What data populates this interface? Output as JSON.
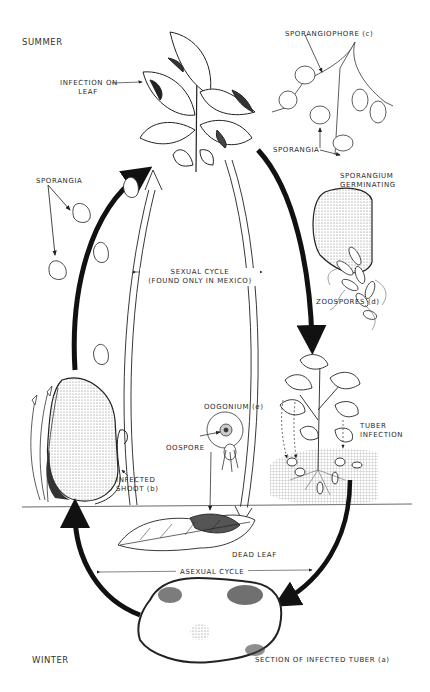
{
  "diagram": {
    "seasons": {
      "top": "SUMMER",
      "bottom": "WINTER"
    },
    "labels": {
      "infection_on_leaf_1": "INFECTION ON",
      "infection_on_leaf_2": "LEAF",
      "sporangiophore": "SPORANGIOPHORE (c)",
      "sporangia_right": "SPORANGIA",
      "sporangium_germinating_1": "SPORANGIUM",
      "sporangium_germinating_2": "GERMINATING",
      "zoospores": "ZOOSPORES (d)",
      "sporangia_left": "SPORANGIA",
      "sexual_cycle_1": "SEXUAL CYCLE",
      "sexual_cycle_2": "(FOUND ONLY IN MEXICO)",
      "tuber_infection_1": "TUBER",
      "tuber_infection_2": "INFECTION",
      "oogonium": "OOGONIUM (e)",
      "oospore": "OOSPORE",
      "infected_shoot_1": "INFECTED",
      "infected_shoot_2": "SHOOT (b)",
      "dead_leaf": "DEAD LEAF",
      "asexual_cycle": "ASEXUAL CYCLE",
      "infected_tuber": "SECTION OF INFECTED TUBER (a)"
    },
    "colors": {
      "ink": "#1a1a1a",
      "background": "#ffffff",
      "stipple": "#9a9a9a"
    }
  }
}
